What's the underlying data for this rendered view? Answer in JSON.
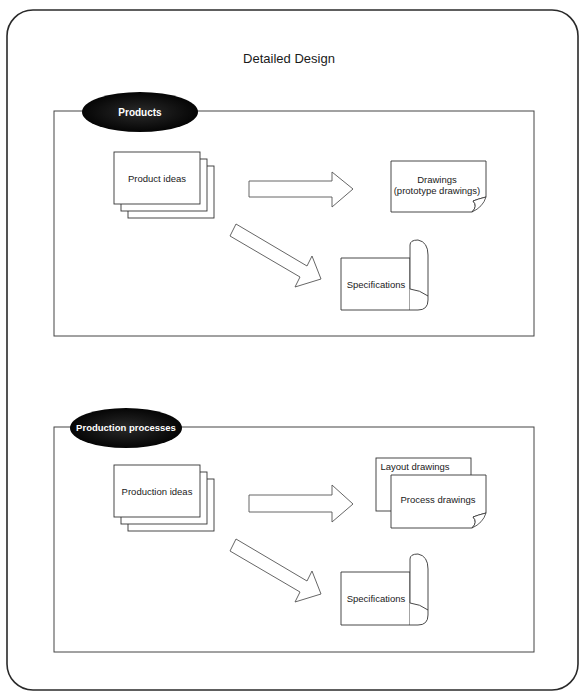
{
  "title": "Detailed Design",
  "sections": [
    {
      "label": "Products",
      "source": "Product ideas",
      "outputs": {
        "drawings_line1": "Drawings",
        "drawings_line2": "(prototype drawings)",
        "specifications": "Specifications"
      }
    },
    {
      "label": "Production processes",
      "source": "Production ideas",
      "outputs": {
        "back_drawing": "Layout drawings",
        "front_drawing": "Process drawings",
        "specifications": "Specifications"
      }
    }
  ],
  "colors": {
    "stroke": "#2a2a2a",
    "badge_fill": "#0d0d0d",
    "badge_text": "#ffffff",
    "background": "#ffffff"
  }
}
